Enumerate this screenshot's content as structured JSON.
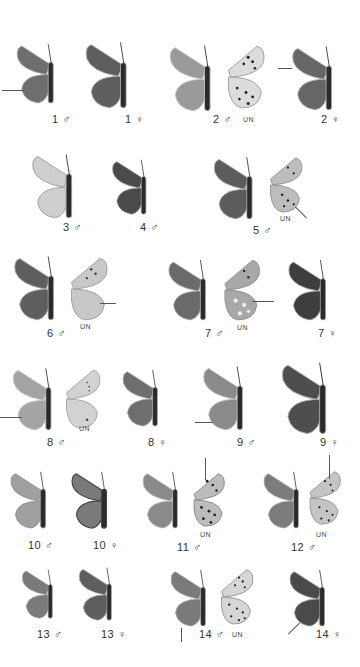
{
  "plate": {
    "background": "#ffffff",
    "underside_marker": "UN",
    "specimens": [
      {
        "id": "1m",
        "label": "1 ♂",
        "view": "upperside"
      },
      {
        "id": "1f",
        "label": "1 ♀",
        "view": "upperside"
      },
      {
        "id": "2m",
        "label": "2 ♂",
        "view": "upperside+underside"
      },
      {
        "id": "2f",
        "label": "2 ♀",
        "view": "upperside"
      },
      {
        "id": "3m",
        "label": "3 ♂",
        "view": "upperside"
      },
      {
        "id": "4m",
        "label": "4 ♂",
        "view": "upperside"
      },
      {
        "id": "5m",
        "label": "5 ♂",
        "view": "upperside+underside"
      },
      {
        "id": "6m",
        "label": "6 ♂",
        "view": "upperside+underside"
      },
      {
        "id": "7m",
        "label": "7 ♂",
        "view": "upperside+underside"
      },
      {
        "id": "7f",
        "label": "7 ♀",
        "view": "upperside"
      },
      {
        "id": "8m",
        "label": "8 ♂",
        "view": "upperside+underside"
      },
      {
        "id": "8f",
        "label": "8 ♀",
        "view": "upperside"
      },
      {
        "id": "9m",
        "label": "9 ♂",
        "view": "upperside"
      },
      {
        "id": "9f",
        "label": "9 ♀",
        "view": "upperside"
      },
      {
        "id": "10m",
        "label": "10 ♂",
        "view": "upperside"
      },
      {
        "id": "10f",
        "label": "10 ♀",
        "view": "upperside"
      },
      {
        "id": "11m",
        "label": "11 ♂",
        "view": "upperside+underside"
      },
      {
        "id": "12m",
        "label": "12 ♂",
        "view": "upperside+underside"
      },
      {
        "id": "13m",
        "label": "13 ♂",
        "view": "upperside"
      },
      {
        "id": "13f",
        "label": "13 ♀",
        "view": "upperside"
      },
      {
        "id": "14m",
        "label": "14 ♂",
        "view": "upperside+underside"
      },
      {
        "id": "14f",
        "label": "14 ♀",
        "view": "upperside"
      }
    ]
  },
  "labels": {
    "l1m": "1 ♂",
    "l1f": "1 ♀",
    "l2m": "2 ♂",
    "l2f": "2 ♀",
    "l3m": "3 ♂",
    "l4m": "4 ♂",
    "l5m": "5 ♂",
    "l6m": "6 ♂",
    "l7m": "7 ♂",
    "l7f": "7 ♀",
    "l8m": "8 ♂",
    "l8f": "8 ♀",
    "l9m": "9 ♂",
    "l9f": "9 ♀",
    "l10m": "10 ♂",
    "l10f": "10 ♀",
    "l11m": "11 ♂",
    "l12m": "12 ♂",
    "l13m": "13 ♂",
    "l13f": "13 ♀",
    "l14m": "14 ♂",
    "l14f": "14 ♀",
    "un": "UN"
  }
}
